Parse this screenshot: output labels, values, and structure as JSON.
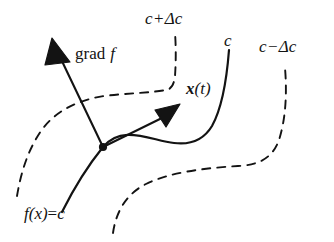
{
  "figure": {
    "background_color": "#ffffff",
    "stroke_color": "#131313",
    "width": 334,
    "height": 242
  },
  "labels": {
    "level_above": {
      "full": "c + Δc",
      "variable": "c",
      "operator": "+",
      "delta": "Δc"
    },
    "level_center": {
      "full": "c",
      "variable": "c"
    },
    "level_below": {
      "full": "c − Δc",
      "variable": "c",
      "operator": "−",
      "delta": "Δc"
    },
    "gradient": {
      "full": "grad f",
      "operator": "grad",
      "function": "f"
    },
    "path": {
      "full": "x(t)",
      "vector": "x",
      "argument": "(t)"
    },
    "level_set_equation": {
      "full": "f(x) = c",
      "left": "f(x)",
      "relation": "=",
      "right": "c"
    }
  },
  "curves": {
    "level_c": {
      "name": "f(x) = c",
      "style": "solid",
      "description": "S-shaped level curve through the marked point"
    },
    "level_c_plus": {
      "name": "c + Δc",
      "style": "dashed",
      "description": "neighboring level curve to the upper left"
    },
    "level_c_minus": {
      "name": "c − Δc",
      "style": "dashed",
      "description": "neighboring level curve to the lower right"
    }
  },
  "vectors": {
    "gradient_arrow": {
      "name": "grad f",
      "direction": "up-left, normal to the level curve"
    },
    "velocity_arrow": {
      "name": "x(t)",
      "direction": "up-right, tangent to the level curve"
    }
  },
  "points": {
    "base_point": {
      "name": "point of tangency",
      "x": 103,
      "y": 147
    }
  }
}
